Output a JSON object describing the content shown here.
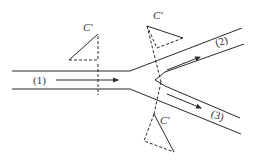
{
  "diagram": {
    "type": "branching-channel-flow",
    "colors": {
      "line": "#2a2a2a",
      "background": "#ffffff"
    },
    "channels": [
      {
        "id": "1",
        "label": "(1)"
      },
      {
        "id": "2",
        "label": "(2)"
      },
      {
        "id": "3",
        "label": "(3)"
      }
    ],
    "control_surfaces": [
      {
        "id": "c1",
        "label": "C'"
      },
      {
        "id": "c2",
        "label": "C'"
      },
      {
        "id": "c3",
        "label": "C'"
      }
    ]
  }
}
